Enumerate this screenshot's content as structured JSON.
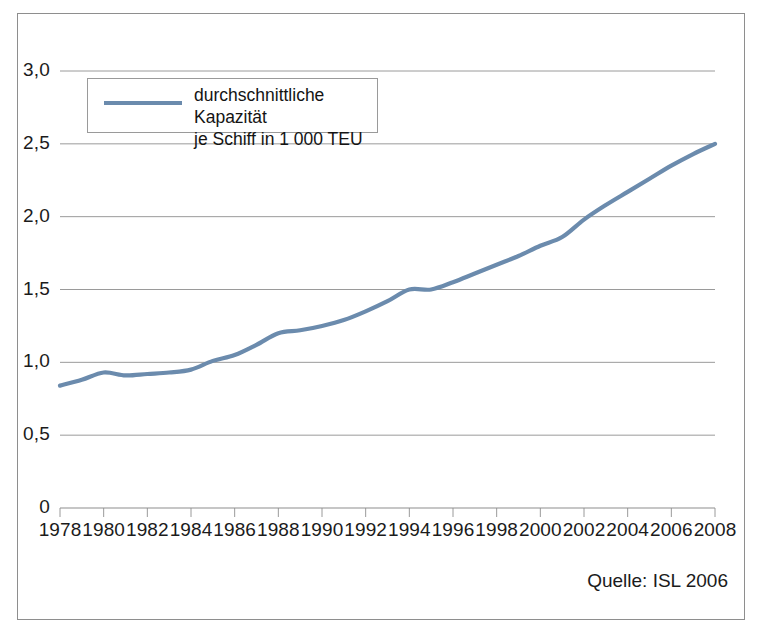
{
  "chart_data": {
    "type": "line",
    "title": "",
    "subtitle": "",
    "xlabel": "",
    "ylabel": "",
    "xlim": [
      1978,
      2008
    ],
    "ylim": [
      0,
      3.0
    ],
    "grid": true,
    "legend_position": "top-left-inside",
    "line_color": "#6b8bad",
    "x_tick_labels": [
      "1978",
      "1980",
      "1982",
      "1984",
      "1986",
      "1988",
      "1990",
      "1992",
      "1994",
      "1996",
      "1998",
      "2000",
      "2002",
      "2004",
      "2006",
      "2008"
    ],
    "x_ticks": [
      1978,
      1980,
      1982,
      1984,
      1986,
      1988,
      1990,
      1992,
      1994,
      1996,
      1998,
      2000,
      2002,
      2004,
      2006,
      2008
    ],
    "y_tick_labels": [
      "0",
      "0,5",
      "1,0",
      "1,5",
      "2,0",
      "2,5",
      "3,0"
    ],
    "y_ticks": [
      0,
      0.5,
      1.0,
      1.5,
      2.0,
      2.5,
      3.0
    ],
    "series": [
      {
        "name": "durchschnittliche Kapazität je Schiff in 1 000 TEU",
        "x": [
          1978,
          1979,
          1980,
          1981,
          1982,
          1983,
          1984,
          1985,
          1986,
          1987,
          1988,
          1989,
          1990,
          1991,
          1992,
          1993,
          1994,
          1995,
          1996,
          1997,
          1998,
          1999,
          2000,
          2001,
          2002,
          2003,
          2004,
          2005,
          2006,
          2007,
          2008
        ],
        "values": [
          0.84,
          0.88,
          0.93,
          0.91,
          0.92,
          0.93,
          0.95,
          1.01,
          1.05,
          1.12,
          1.2,
          1.22,
          1.25,
          1.29,
          1.35,
          1.42,
          1.5,
          1.5,
          1.55,
          1.61,
          1.67,
          1.73,
          1.8,
          1.86,
          1.98,
          2.08,
          2.17,
          2.26,
          2.35,
          2.43,
          2.5
        ]
      }
    ]
  },
  "legend": {
    "label": "durchschnittliche Kapazität\nje Schiff in 1 000 TEU",
    "swatch_color": "#6b8bad"
  },
  "source": {
    "text": "Quelle: ISL 2006"
  }
}
